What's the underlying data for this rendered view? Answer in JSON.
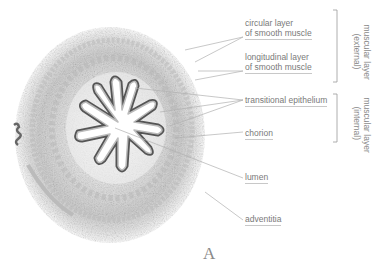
{
  "figure": {
    "panel_letter": "A",
    "labels": {
      "circular": [
        "circular layer",
        "of smooth muscle"
      ],
      "longitudinal": [
        "longitudinal layer",
        "of smooth muscle"
      ],
      "transitional": "transitional epithelium",
      "chorion": "chorion",
      "lumen": "lumen",
      "adventitia": "adventitia"
    },
    "brackets": {
      "external": [
        "muscular layer",
        "(external)"
      ],
      "internal": [
        "muscular layer",
        "(internal)"
      ]
    },
    "colors": {
      "text": "#7a7a7a",
      "line": "#b0b0b0",
      "tissue": "#9a9a9a"
    }
  }
}
